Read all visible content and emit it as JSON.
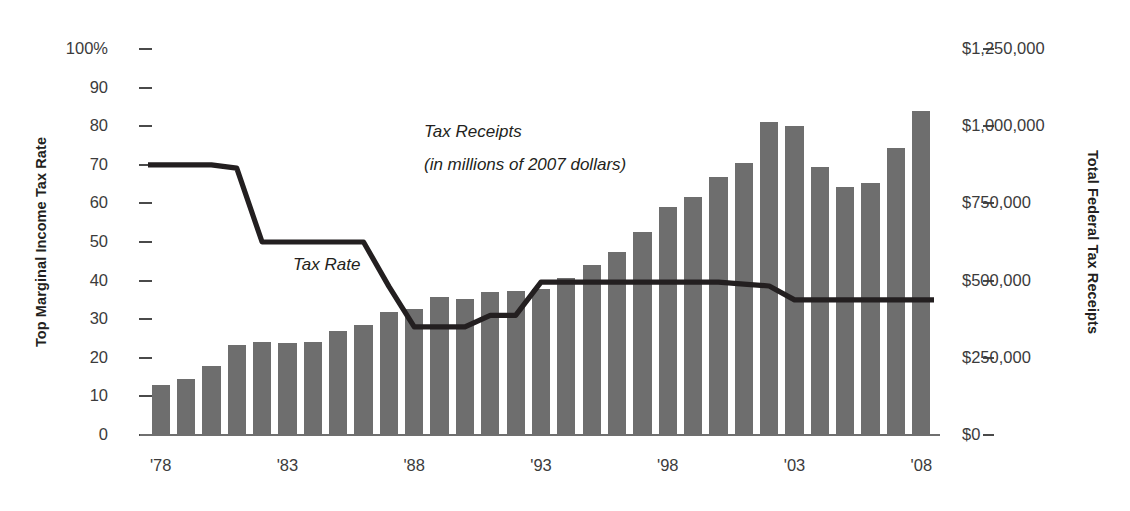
{
  "chart_data": {
    "type": "bar",
    "title": "",
    "xlabel": "",
    "ylabel": "Top Marginal Income Tax Rate",
    "y2label": "Total Federal Tax Receipts",
    "grid": false,
    "legend_position": "inline-annotations",
    "x": [
      1978,
      1979,
      1980,
      1981,
      1982,
      1983,
      1984,
      1985,
      1986,
      1987,
      1988,
      1989,
      1990,
      1991,
      1992,
      1993,
      1994,
      1995,
      1996,
      1997,
      1998,
      1999,
      2000,
      2001,
      2002,
      2003,
      2004,
      2005,
      2006,
      2007,
      2008
    ],
    "x_tick_labels": [
      "'78",
      "'83",
      "'88",
      "'93",
      "'98",
      "'03",
      "'08"
    ],
    "x_tick_values": [
      1978,
      1983,
      1988,
      1993,
      1998,
      2003,
      2008
    ],
    "ylim": [
      0,
      100
    ],
    "y_ticks": [
      0,
      10,
      20,
      30,
      40,
      50,
      60,
      70,
      80,
      90,
      100
    ],
    "y_tick_labels": [
      "0",
      "10",
      "20",
      "30",
      "40",
      "50",
      "60",
      "70",
      "80",
      "90",
      "100%"
    ],
    "y2lim": [
      0,
      1250000
    ],
    "y2_ticks": [
      0,
      250000,
      500000,
      750000,
      1000000,
      1250000
    ],
    "y2_tick_labels": [
      "$0",
      "$250,000",
      "$500,000",
      "$750,000",
      "$1,000,000",
      "$1,250,000"
    ],
    "series": [
      {
        "name": "Tax Receipts",
        "type": "bar",
        "axis": "right",
        "unit": "millions of 2007 dollars",
        "color": "#6e6e6e",
        "values": [
          162000,
          183000,
          222000,
          290000,
          300000,
          298000,
          300000,
          337000,
          355000,
          398000,
          408000,
          448000,
          442000,
          464000,
          467000,
          472000,
          510000,
          549000,
          593000,
          656000,
          740000,
          772000,
          834000,
          882000,
          1014000,
          1001000,
          867000,
          802000,
          817000,
          930000,
          1050000
        ]
      },
      {
        "name": "Tax Rate",
        "type": "line",
        "axis": "left",
        "unit": "percent",
        "color": "#231f20",
        "values": [
          70,
          70,
          70,
          69.125,
          50,
          50,
          50,
          50,
          50,
          38.5,
          28,
          28,
          28,
          31,
          31,
          39.6,
          39.6,
          39.6,
          39.6,
          39.6,
          39.6,
          39.6,
          39.6,
          39.1,
          38.6,
          35,
          35,
          35,
          35,
          35,
          35
        ]
      }
    ],
    "annotations": [
      {
        "id": "tax-receipts",
        "line1": "Tax Receipts",
        "line2": "(in millions of 2007 dollars)"
      },
      {
        "id": "tax-rate",
        "text": "Tax Rate"
      }
    ],
    "colors": {
      "bar": "#6e6e6e",
      "line": "#231f20",
      "axis": "#6f6f6f",
      "text": "#231f20",
      "tick_text": "#3b3b3b",
      "background": "#ffffff"
    }
  }
}
